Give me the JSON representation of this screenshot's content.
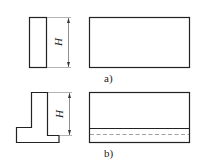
{
  "figure": {
    "a": {
      "label": "a)",
      "dimension": "H"
    },
    "b": {
      "label": "b)",
      "dimension": "H"
    }
  },
  "colors": {
    "line": "#222222",
    "hidden_line": "#888888",
    "background": "#ffffff"
  }
}
